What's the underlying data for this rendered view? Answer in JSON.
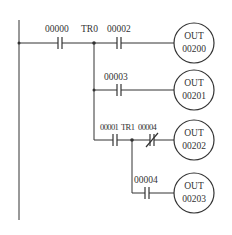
{
  "diagram": {
    "type": "ladder-logic",
    "rungs": [
      {
        "contacts": [
          {
            "address": "00000",
            "kind": "NO"
          },
          {
            "address": "00002",
            "kind": "NO"
          }
        ],
        "junction": "TR0",
        "coil": {
          "prefix": "OUT",
          "address": "00200"
        }
      },
      {
        "contacts": [
          {
            "address": "00003",
            "kind": "NO"
          }
        ],
        "coil": {
          "prefix": "OUT",
          "address": "00201"
        }
      },
      {
        "contacts": [
          {
            "address": "00001",
            "kind": "NO"
          },
          {
            "address": "00004",
            "kind": "NC"
          }
        ],
        "junction": "TR1",
        "coil": {
          "prefix": "OUT",
          "address": "00202"
        }
      },
      {
        "contacts": [
          {
            "address": "00004",
            "kind": "NO"
          }
        ],
        "coil": {
          "prefix": "OUT",
          "address": "00203"
        }
      }
    ]
  }
}
